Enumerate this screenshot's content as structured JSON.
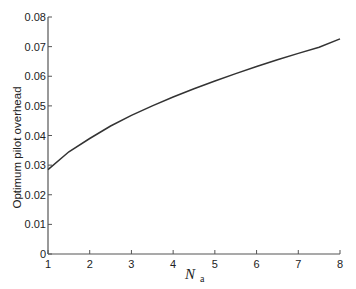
{
  "chart_data": {
    "type": "line",
    "title": "",
    "xlabel": "N_a",
    "xlabel_main": "N",
    "xlabel_sub": "a",
    "ylabel": "Optimum pilot overhead",
    "xlim": [
      1,
      8
    ],
    "ylim": [
      0,
      0.08
    ],
    "xticks": [
      "1",
      "2",
      "3",
      "4",
      "5",
      "6",
      "7",
      "8"
    ],
    "yticks": [
      "0",
      "0.01",
      "0.02",
      "0.03",
      "0.04",
      "0.05",
      "0.06",
      "0.07",
      "0.08"
    ],
    "grid": false,
    "legend": null,
    "series": [
      {
        "name": "Optimum pilot overhead",
        "color": "#333333",
        "x": [
          1,
          1.5,
          2,
          2.5,
          3,
          3.5,
          4,
          4.5,
          5,
          5.5,
          6,
          6.5,
          7,
          7.5,
          8
        ],
        "y": [
          0.0285,
          0.0345,
          0.039,
          0.0432,
          0.0468,
          0.05,
          0.053,
          0.0558,
          0.0584,
          0.0609,
          0.0633,
          0.0656,
          0.0677,
          0.0698,
          0.0726
        ]
      }
    ]
  }
}
